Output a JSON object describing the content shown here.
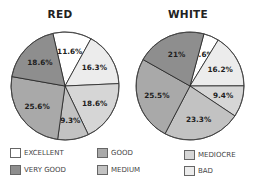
{
  "chart_data": [
    {
      "type": "pie",
      "title": "RED",
      "slices": [
        {
          "label": "EXCELLENT",
          "value": 11.6,
          "text": "11.6%"
        },
        {
          "label": "BAD",
          "value": 16.3,
          "text": "16.3%"
        },
        {
          "label": "MEDIOCRE",
          "value": 18.6,
          "text": "18.6%"
        },
        {
          "label": "MEDIUM",
          "value": 9.3,
          "text": "9.3%"
        },
        {
          "label": "GOOD",
          "value": 25.6,
          "text": "25.6%"
        },
        {
          "label": "VERY GOOD",
          "value": 18.6,
          "text": "18.6%"
        }
      ]
    },
    {
      "type": "pie",
      "title": "WHITE",
      "slices": [
        {
          "label": "EXCELLENT",
          "value": 4.6,
          "text": "4.6%"
        },
        {
          "label": "BAD",
          "value": 16.2,
          "text": "16.2%"
        },
        {
          "label": "MEDIOCRE",
          "value": 9.4,
          "text": "9.4%"
        },
        {
          "label": "MEDIUM",
          "value": 23.3,
          "text": "23.3%"
        },
        {
          "label": "GOOD",
          "value": 25.5,
          "text": "25.5%"
        },
        {
          "label": "VERY GOOD",
          "value": 21,
          "text": "21%"
        }
      ]
    }
  ],
  "legend": [
    {
      "label": "EXCELLENT",
      "color": "#ffffff"
    },
    {
      "label": "GOOD",
      "color": "#a9a9a9"
    },
    {
      "label": "MEDIOCRE",
      "color": "#d6d6d6"
    },
    {
      "label": "VERY GOOD",
      "color": "#8e8e8e"
    },
    {
      "label": "MEDIUM",
      "color": "#c2c2c2"
    },
    {
      "label": "BAD",
      "color": "#ececec"
    }
  ],
  "colors": {
    "EXCELLENT": "#ffffff",
    "BAD": "#ececec",
    "MEDIOCRE": "#d6d6d6",
    "MEDIUM": "#c2c2c2",
    "GOOD": "#a9a9a9",
    "VERY GOOD": "#8e8e8e"
  }
}
